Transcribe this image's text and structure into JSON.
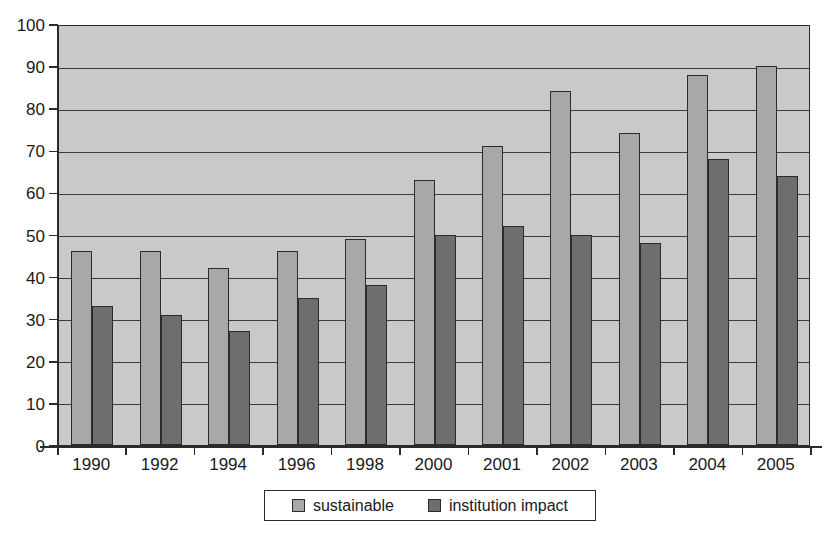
{
  "chart_data": {
    "type": "bar",
    "title": "",
    "subtitle": "",
    "xlabel": "",
    "ylabel": "",
    "categories": [
      "1990",
      "1992",
      "1994",
      "1996",
      "1998",
      "2000",
      "2001",
      "2002",
      "2003",
      "2004",
      "2005"
    ],
    "series": [
      {
        "name": "sustainable",
        "color": "#a8a8a8",
        "values": [
          46,
          46,
          42,
          46,
          49,
          63,
          71,
          84,
          74,
          88,
          90
        ]
      },
      {
        "name": "institution impact",
        "color": "#6e6e6e",
        "values": [
          33,
          31,
          27,
          35,
          38,
          50,
          52,
          50,
          48,
          68,
          64
        ]
      }
    ],
    "ylim": [
      0,
      100
    ],
    "ytick_step": 10,
    "yticks": [
      "0",
      "10",
      "20",
      "30",
      "40",
      "50",
      "60",
      "70",
      "80",
      "90",
      "100"
    ],
    "grid": true,
    "grid_axis": "y",
    "legend_position": "bottom",
    "plot_background": "#c9c9c9",
    "axis_color": "#2b2b2b",
    "page_background": "#ffffff"
  }
}
